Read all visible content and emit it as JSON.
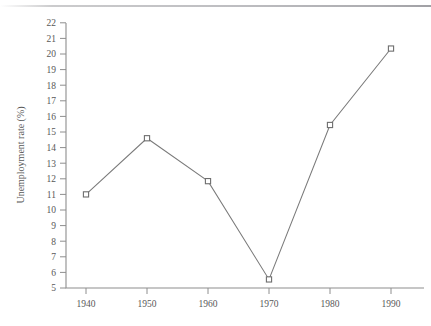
{
  "chart_data": {
    "type": "line",
    "title": "",
    "subtitle": "",
    "xlabel": "",
    "ylabel": "Unemployment rate (%)",
    "x": [
      1940,
      1950,
      1960,
      1970,
      1980,
      1990
    ],
    "categories": [
      "1940",
      "1950",
      "1960",
      "1970",
      "1980",
      "1990"
    ],
    "values": [
      11.0,
      14.6,
      11.85,
      5.55,
      15.45,
      20.35
    ],
    "series": [
      {
        "name": "Unemployment rate",
        "values": [
          11.0,
          14.6,
          11.85,
          5.55,
          15.45,
          20.35
        ]
      }
    ],
    "xlim": [
      1935,
      1995
    ],
    "ylim": [
      5,
      22
    ],
    "xticks": [
      1940,
      1950,
      1960,
      1970,
      1980,
      1990
    ],
    "xtick_labels": [
      "1940",
      "1950",
      "1960",
      "1970",
      "1980",
      "1990"
    ],
    "yticks": [
      5,
      6,
      7,
      8,
      9,
      10,
      11,
      12,
      13,
      14,
      15,
      16,
      17,
      18,
      19,
      20,
      21,
      22
    ],
    "ytick_labels": [
      "5",
      "6",
      "7",
      "8",
      "9",
      "10",
      "11",
      "12",
      "13",
      "14",
      "15",
      "16",
      "17",
      "18",
      "19",
      "20",
      "21",
      "22"
    ],
    "grid": false,
    "legend": false,
    "legend_position": "none",
    "marker": "open-square",
    "annotations": [],
    "colors": {
      "line": "#7a7a7a",
      "marker_face": "#ffffff",
      "marker_edge": "#6e6e6e",
      "axis": "#8e8e8e",
      "text": "#585858",
      "background": "#ffffff"
    }
  }
}
